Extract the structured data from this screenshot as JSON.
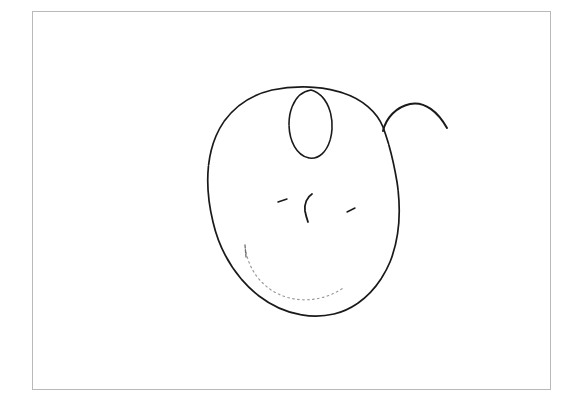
{
  "artwork": {
    "title": "Hand-drawn apple face sketch",
    "medium": "pencil line drawing on white paper",
    "background_color": "#ffffff",
    "ink_color": "#1a1a1a",
    "faint_ink_color": "#6d6d6d",
    "frame": {
      "border_color": "#b9b9b9",
      "x": 32,
      "y": 11,
      "width": 519,
      "height": 379,
      "border_width": 1
    },
    "canvas": {
      "width": 578,
      "height": 406
    }
  },
  "strokes": [
    {
      "name": "main-body-outline",
      "description": "large rounded apple-like body outline, open at upper right",
      "path": "M 383 127 C 377 112 362 99 343 93 C 322 86 296 85 272 90 C 247 96 226 112 216 136 C 205 162 206 193 213 222 C 220 252 236 278 259 296 C 281 313 309 320 334 314 C 359 308 379 288 390 262 C 400 237 401 208 397 182 C 394 164 390 146 383 127",
      "stroke_width": 1.7
    },
    {
      "name": "inner-loop",
      "description": "small vertical ellipse loop overlapping the top of the body",
      "path": "M 311 90 C 297 92 289 107 289 124 C 289 140 296 155 309 158 C 322 160 331 146 332 129 C 333 112 326 96 314 91 Z",
      "stroke_width": 1.6
    },
    {
      "name": "stem-arc",
      "description": "arc rising from the body junction and curving down to the right, like a stem or eyebrow",
      "path": "M 383 131 C 386 118 396 107 410 104 C 425 101 438 112 447 128",
      "stroke_width": 2.0
    },
    {
      "name": "nose-stroke",
      "description": "vertical hooked stroke in the middle of the face, like a nose",
      "path": "M 312 194 C 307 197 304 204 305 211 C 306 216 307 219 308 222",
      "stroke_width": 1.8
    },
    {
      "name": "left-eye-mark",
      "description": "short slanted tick mark, left eye",
      "path": "M 278 202 L 287 199",
      "stroke_width": 1.4
    },
    {
      "name": "right-eye-mark",
      "description": "short slanted tick mark, right eye",
      "path": "M 347 212 L 355 208",
      "stroke_width": 1.4
    },
    {
      "name": "mouth-arc",
      "description": "faint dotted arc inside the lower left of the body, like a smile",
      "path": "M 246 252 C 250 272 264 290 286 297 C 306 303 327 299 343 288",
      "stroke_width": 1.2
    },
    {
      "name": "chin-tick",
      "description": "short vertical tick above the mouth arc on the left",
      "path": "M 245 245 L 246 257",
      "stroke_width": 1.3
    }
  ]
}
